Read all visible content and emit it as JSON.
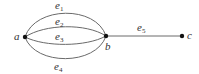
{
  "diagram": {
    "type": "multigraph",
    "nodes": [
      {
        "id": "a",
        "label": "a",
        "x": 25,
        "y": 37
      },
      {
        "id": "b",
        "label": "b",
        "x": 106,
        "y": 36
      },
      {
        "id": "c",
        "label": "c",
        "x": 182,
        "y": 36
      }
    ],
    "edges": [
      {
        "id": "e1",
        "label": "e",
        "sub": "1",
        "from": "a",
        "to": "b"
      },
      {
        "id": "e2",
        "label": "e",
        "sub": "2",
        "from": "a",
        "to": "b"
      },
      {
        "id": "e3",
        "label": "e",
        "sub": "3",
        "from": "a",
        "to": "b"
      },
      {
        "id": "e4",
        "label": "e",
        "sub": "4",
        "from": "a",
        "to": "b"
      },
      {
        "id": "e5",
        "label": "e",
        "sub": "5",
        "from": "b",
        "to": "c"
      }
    ],
    "colors": {
      "edge": "#6a6a6a",
      "node": "#111111",
      "text": "#333333"
    }
  }
}
